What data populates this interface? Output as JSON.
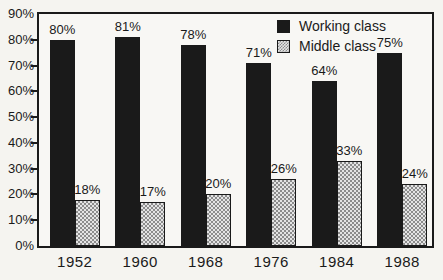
{
  "figure": {
    "background": "#f5f4f0",
    "plot_background": "#f8f7f4",
    "ink_color": "#1a1a1a"
  },
  "chart_data": {
    "type": "bar",
    "title": "",
    "xlabel": "",
    "ylabel": "",
    "categories": [
      "1952",
      "1960",
      "1968",
      "1976",
      "1984",
      "1988"
    ],
    "series": [
      {
        "name": "Working class",
        "values": [
          80,
          81,
          78,
          71,
          64,
          75
        ],
        "labels": [
          "80%",
          "81%",
          "78%",
          "71%",
          "64%",
          "75%"
        ],
        "fill": "#1a1a1a",
        "pattern": "solid"
      },
      {
        "name": "Middle class",
        "values": [
          18,
          17,
          20,
          26,
          33,
          24
        ],
        "labels": [
          "18%",
          "17%",
          "20%",
          "26%",
          "33%",
          "24%"
        ],
        "fill": "#e4e4e4",
        "pattern": "checker",
        "pattern_dot_color": "#8c8c8c",
        "border_color": "#1a1a1a"
      }
    ],
    "ylim": [
      0,
      90
    ],
    "ytick_step": 10,
    "ytick_labels": [
      "0%",
      "10%",
      "20%",
      "30%",
      "40%",
      "50%",
      "60%",
      "70%",
      "80%",
      "90%"
    ],
    "value_labels_shown": true,
    "grid": false,
    "legend": {
      "position": "top-right",
      "entries": [
        "Working class",
        "Middle class"
      ]
    }
  }
}
